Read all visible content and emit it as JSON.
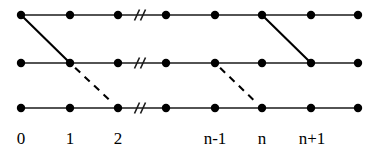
{
  "figure": {
    "canvas": {
      "width": 379,
      "height": 155,
      "background": "#ffffff"
    },
    "style": {
      "node_color": "#000000",
      "node_radius": 4.2,
      "line_color": "#1a1a1a",
      "edge_color": "#000000"
    },
    "rows": [
      {
        "id": "row-top",
        "y": 15,
        "name": "top-row"
      },
      {
        "id": "row-middle",
        "y": 63,
        "name": "middle-row"
      },
      {
        "id": "row-bottom",
        "y": 108,
        "name": "bottom-row"
      }
    ],
    "columns": [
      {
        "index": 0,
        "x": 21,
        "label": "0"
      },
      {
        "index": 1,
        "x": 70,
        "label": "1"
      },
      {
        "index": 2,
        "x": 118,
        "label": "2"
      },
      {
        "index": 3,
        "x": 166,
        "label": ""
      },
      {
        "index": 4,
        "x": 215,
        "label": "n-1"
      },
      {
        "index": 5,
        "x": 262,
        "label": "n"
      },
      {
        "index": 6,
        "x": 311,
        "label": "n+1"
      },
      {
        "index": 7,
        "x": 358,
        "label": ""
      }
    ],
    "axis_extent": {
      "x_start": 21,
      "x_end": 358
    },
    "break_mark": {
      "x": 137,
      "name": "axis-break",
      "slash_count": 2,
      "slash_gap": 6,
      "slash_dx": 5,
      "slash_dy": 11
    },
    "solid_edges": [
      {
        "name": "edge-top0-to-mid1",
        "from": {
          "col": 0,
          "row": "top"
        },
        "to": {
          "col": 1,
          "row": "middle"
        }
      },
      {
        "name": "edge-top5-to-mid6",
        "from": {
          "col": 5,
          "row": "top"
        },
        "to": {
          "col": 6,
          "row": "middle"
        }
      }
    ],
    "dashed_edges": [
      {
        "name": "edge-mid1-to-bot2",
        "from": {
          "col": 1,
          "row": "middle"
        },
        "to": {
          "col": 2,
          "row": "bottom"
        }
      },
      {
        "name": "edge-mid4-to-bot5",
        "from": {
          "col": 4,
          "row": "middle"
        },
        "to": {
          "col": 5,
          "row": "bottom"
        }
      }
    ],
    "labels": {
      "y": 144,
      "items": [
        {
          "name": "tick-label-0",
          "text": "0",
          "x": 21
        },
        {
          "name": "tick-label-1",
          "text": "1",
          "x": 70
        },
        {
          "name": "tick-label-2",
          "text": "2",
          "x": 118
        },
        {
          "name": "tick-label-n-1",
          "text": "n-1",
          "x": 215
        },
        {
          "name": "tick-label-n",
          "text": "n",
          "x": 262
        },
        {
          "name": "tick-label-n+1",
          "text": "n+1",
          "x": 312
        }
      ]
    }
  },
  "chart_data": {
    "type": "diagram",
    "xlabel": "",
    "ylabel": "",
    "grid": false,
    "legend": null,
    "x_tick_labels": [
      "0",
      "1",
      "2",
      "",
      "n-1",
      "n",
      "n+1",
      ""
    ],
    "rows": [
      "top",
      "middle",
      "bottom"
    ],
    "node_grid": [
      {
        "row": "top",
        "columns": [
          0,
          1,
          2,
          3,
          4,
          5,
          6,
          7
        ]
      },
      {
        "row": "middle",
        "columns": [
          0,
          1,
          2,
          3,
          4,
          5,
          6,
          7
        ]
      },
      {
        "row": "bottom",
        "columns": [
          0,
          1,
          2,
          3,
          4,
          5,
          6,
          7
        ]
      }
    ],
    "edges": [
      {
        "style": "solid",
        "from_row": "top",
        "from_col": 0,
        "to_row": "middle",
        "to_col": 1
      },
      {
        "style": "solid",
        "from_row": "top",
        "from_col": 5,
        "to_row": "middle",
        "to_col": 6
      },
      {
        "style": "dashed",
        "from_row": "middle",
        "from_col": 1,
        "to_row": "bottom",
        "to_col": 2
      },
      {
        "style": "dashed",
        "from_row": "middle",
        "from_col": 4,
        "to_row": "bottom",
        "to_col": 5
      }
    ],
    "annotations": [
      {
        "type": "axis-break",
        "text": "//",
        "rows": [
          "top",
          "middle",
          "bottom"
        ],
        "between_cols": [
          2,
          3
        ]
      }
    ]
  }
}
